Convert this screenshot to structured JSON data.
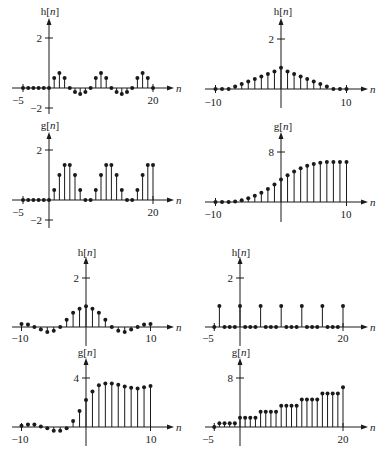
{
  "figure": {
    "panels_count": 8,
    "colors": {
      "ink": "#1a1a1a",
      "background": "#ffffff"
    }
  },
  "chart_data": [
    {
      "id": "tl-h",
      "type": "stem",
      "title": "h[n]",
      "xlabel": "n",
      "x_tick_labels": [
        "-5",
        "20"
      ],
      "y_tick_labels": [
        "2",
        "-2"
      ],
      "xlim": [
        -5,
        20
      ],
      "ylim": [
        -2,
        2
      ],
      "x": [
        -5,
        -4,
        -3,
        -2,
        -1,
        0,
        1,
        2,
        3,
        4,
        5,
        6,
        7,
        8,
        9,
        10,
        11,
        12,
        13,
        14,
        15,
        16,
        17,
        18,
        19,
        20
      ],
      "values": [
        0,
        0,
        0,
        0,
        0,
        0,
        0.4,
        0.6,
        0.4,
        0,
        -0.4,
        -0.6,
        -0.4,
        0,
        0.4,
        0.6,
        0.4,
        0,
        -0.4,
        -0.6,
        -0.4,
        0,
        0.4,
        0.6,
        0.4,
        0
      ],
      "layout": {
        "x0": 49,
        "xscale": 5.2,
        "axis_y": 88,
        "yscale_up": 25,
        "yscale_down": 10,
        "ytick_pos_y": 38,
        "ytick_neg_y": 108,
        "axis_left": 12,
        "axis_right": 168,
        "axis_top": 24,
        "axis_bottom": 114,
        "title_x": 50,
        "title_y": 15,
        "n_label_x": 176,
        "xtick_label_y": 104,
        "xtick_label_xs": [
          18,
          153
        ]
      }
    },
    {
      "id": "tl-g",
      "type": "stem",
      "title": "g[n]",
      "xlabel": "n",
      "x_tick_labels": [
        "-5",
        "20"
      ],
      "y_tick_labels": [
        "2",
        "-2"
      ],
      "xlim": [
        -5,
        20
      ],
      "ylim": [
        -2,
        2
      ],
      "x": [
        -5,
        -4,
        -3,
        -2,
        -1,
        0,
        1,
        2,
        3,
        4,
        5,
        6,
        7,
        8,
        9,
        10,
        11,
        12,
        13,
        14,
        15,
        16,
        17,
        18,
        19,
        20
      ],
      "values": [
        0,
        0,
        0,
        0,
        0,
        0,
        0.4,
        1.0,
        1.4,
        1.4,
        1.0,
        0.4,
        0,
        0,
        0.4,
        1.0,
        1.4,
        1.4,
        1.0,
        0.4,
        0,
        0,
        0.4,
        1.0,
        1.4,
        1.4
      ],
      "layout": {
        "x0": 49,
        "xscale": 5.2,
        "axis_y": 200,
        "yscale_up": 25,
        "yscale_down": 10,
        "ytick_pos_y": 150,
        "ytick_neg_y": 220,
        "axis_left": 12,
        "axis_right": 168,
        "axis_top": 138,
        "axis_bottom": 228,
        "title_x": 50,
        "title_y": 129,
        "n_label_x": 176,
        "xtick_label_y": 216,
        "xtick_label_xs": [
          18,
          153
        ]
      }
    },
    {
      "id": "tr-h",
      "type": "stem",
      "title": "h[n]",
      "xlabel": "n",
      "x_tick_labels": [
        "-10",
        "10"
      ],
      "y_tick_labels": [
        "2"
      ],
      "xlim": [
        -10,
        10
      ],
      "ylim": [
        0,
        2
      ],
      "x": [
        -10,
        -9,
        -8,
        -7,
        -6,
        -5,
        -4,
        -3,
        -2,
        -1,
        0,
        1,
        2,
        3,
        4,
        5,
        6,
        7,
        8,
        9,
        10
      ],
      "values": [
        0,
        0,
        0,
        0.1,
        0.2,
        0.3,
        0.4,
        0.5,
        0.6,
        0.7,
        0.85,
        0.7,
        0.6,
        0.5,
        0.4,
        0.3,
        0.2,
        0.1,
        0,
        0,
        0
      ],
      "layout": {
        "x0": 281,
        "xscale": 6.55,
        "axis_y": 89,
        "yscale_up": 25,
        "yscale_down": 10,
        "ytick_pos_y": 39,
        "ytick_neg_y": null,
        "axis_left": 205,
        "axis_right": 362,
        "axis_top": 24,
        "axis_bottom": 108,
        "title_x": 283,
        "title_y": 15,
        "n_label_x": 370,
        "xtick_label_y": 106,
        "xtick_label_xs": [
          213,
          346
        ]
      }
    },
    {
      "id": "tr-g",
      "type": "stem",
      "title": "g[n]",
      "xlabel": "n",
      "x_tick_labels": [
        "-10",
        "10"
      ],
      "y_tick_labels": [
        "8"
      ],
      "xlim": [
        -10,
        10
      ],
      "ylim": [
        0,
        8
      ],
      "x": [
        -10,
        -9,
        -8,
        -7,
        -6,
        -5,
        -4,
        -3,
        -2,
        -1,
        0,
        1,
        2,
        3,
        4,
        5,
        6,
        7,
        8,
        9,
        10
      ],
      "values": [
        0,
        0,
        0,
        0.1,
        0.3,
        0.6,
        1.0,
        1.5,
        2.1,
        2.8,
        3.6,
        4.3,
        4.9,
        5.4,
        5.8,
        6.1,
        6.3,
        6.4,
        6.4,
        6.4,
        6.4
      ],
      "layout": {
        "x0": 281,
        "xscale": 6.55,
        "axis_y": 202,
        "yscale_up": 6.25,
        "yscale_down": 6.25,
        "ytick_pos_y": 152,
        "ytick_neg_y": null,
        "axis_left": 205,
        "axis_right": 362,
        "axis_top": 138,
        "axis_bottom": 222,
        "title_x": 283,
        "title_y": 130,
        "n_label_x": 370,
        "xtick_label_y": 218,
        "xtick_label_xs": [
          213,
          346
        ]
      }
    },
    {
      "id": "bl-h",
      "type": "stem",
      "title": "h[n]",
      "xlabel": "n",
      "x_tick_labels": [
        "-10",
        "10"
      ],
      "y_tick_labels": [
        "2"
      ],
      "xlim": [
        -10,
        10
      ],
      "ylim": [
        0,
        2
      ],
      "x": [
        -10,
        -9,
        -8,
        -7,
        -6,
        -5,
        -4,
        -3,
        -2,
        -1,
        0,
        1,
        2,
        3,
        4,
        5,
        6,
        7,
        8,
        9,
        10
      ],
      "values": [
        0.12,
        0.1,
        0,
        -0.1,
        -0.2,
        -0.15,
        0,
        0.3,
        0.58,
        0.75,
        0.85,
        0.75,
        0.58,
        0.3,
        0,
        -0.15,
        -0.2,
        -0.1,
        0,
        0.1,
        0.12
      ],
      "layout": {
        "x0": 86,
        "xscale": 6.45,
        "axis_y": 327,
        "yscale_up": 24.5,
        "yscale_down": 24.5,
        "ytick_pos_y": 278,
        "ytick_neg_y": null,
        "axis_left": 12,
        "axis_right": 168,
        "axis_top": 263,
        "axis_bottom": 346,
        "title_x": 87,
        "title_y": 256,
        "n_label_x": 176,
        "xtick_label_y": 342,
        "xtick_label_xs": [
          20,
          151
        ]
      }
    },
    {
      "id": "bl-g",
      "type": "stem",
      "title": "g[n]",
      "xlabel": "n",
      "x_tick_labels": [
        "-10",
        "10"
      ],
      "y_tick_labels": [
        "4"
      ],
      "xlim": [
        -10,
        10
      ],
      "ylim": [
        0,
        4
      ],
      "x": [
        -10,
        -9,
        -8,
        -7,
        -6,
        -5,
        -4,
        -3,
        -2,
        -1,
        0,
        1,
        2,
        3,
        4,
        5,
        6,
        7,
        8,
        9,
        10
      ],
      "values": [
        0.1,
        0.2,
        0.2,
        0.05,
        -0.1,
        -0.3,
        -0.3,
        -0.1,
        0.5,
        1.3,
        2.2,
        2.9,
        3.4,
        3.55,
        3.55,
        3.45,
        3.3,
        3.2,
        3.15,
        3.25,
        3.35
      ],
      "layout": {
        "x0": 86,
        "xscale": 6.45,
        "axis_y": 427,
        "yscale_up": 12.25,
        "yscale_down": 12.25,
        "ytick_pos_y": 378,
        "ytick_neg_y": null,
        "axis_left": 12,
        "axis_right": 168,
        "axis_top": 364,
        "axis_bottom": 446,
        "title_x": 87,
        "title_y": 356,
        "n_label_x": 176,
        "xtick_label_y": 443,
        "xtick_label_xs": [
          20,
          151
        ]
      }
    },
    {
      "id": "br-h",
      "type": "stem",
      "title": "h[n]",
      "xlabel": "n",
      "x_tick_labels": [
        "-5",
        "20"
      ],
      "y_tick_labels": [
        "2"
      ],
      "xlim": [
        -5,
        20
      ],
      "ylim": [
        0,
        2
      ],
      "x": [
        -5,
        -4,
        -3,
        -2,
        -1,
        0,
        1,
        2,
        3,
        4,
        5,
        6,
        7,
        8,
        9,
        10,
        11,
        12,
        13,
        14,
        15,
        16,
        17,
        18,
        19,
        20
      ],
      "values": [
        0,
        0.86,
        0,
        0,
        0,
        0.86,
        0,
        0,
        0,
        0.86,
        0,
        0,
        0,
        0.86,
        0,
        0,
        0,
        0.86,
        0,
        0,
        0,
        0.86,
        0,
        0,
        0,
        0.86
      ],
      "layout": {
        "x0": 240,
        "xscale": 5.15,
        "axis_y": 327,
        "yscale_up": 24.5,
        "yscale_down": 24.5,
        "ytick_pos_y": 278,
        "ytick_neg_y": null,
        "axis_left": 205,
        "axis_right": 362,
        "axis_top": 263,
        "axis_bottom": 346,
        "title_x": 241,
        "title_y": 256,
        "n_label_x": 370,
        "xtick_label_y": 342,
        "xtick_label_xs": [
          208,
          343
        ]
      }
    },
    {
      "id": "br-g",
      "type": "stem",
      "title": "g[n]",
      "xlabel": "n",
      "x_tick_labels": [
        "-5",
        "20"
      ],
      "y_tick_labels": [
        "8"
      ],
      "xlim": [
        -5,
        20
      ],
      "ylim": [
        0,
        8
      ],
      "x": [
        -5,
        -4,
        -3,
        -2,
        -1,
        0,
        1,
        2,
        3,
        4,
        5,
        6,
        7,
        8,
        9,
        10,
        11,
        12,
        13,
        14,
        15,
        16,
        17,
        18,
        19,
        20
      ],
      "values": [
        0,
        0.6,
        0.6,
        0.6,
        0.6,
        1.5,
        1.5,
        1.5,
        1.5,
        2.5,
        2.5,
        2.5,
        2.5,
        3.5,
        3.5,
        3.5,
        3.5,
        4.5,
        4.5,
        4.5,
        4.5,
        5.5,
        5.5,
        5.5,
        5.5,
        6.5
      ],
      "layout": {
        "x0": 240,
        "xscale": 5.15,
        "axis_y": 427,
        "yscale_up": 6.1,
        "yscale_down": 6.1,
        "ytick_pos_y": 378,
        "ytick_neg_y": null,
        "axis_left": 205,
        "axis_right": 362,
        "axis_top": 364,
        "axis_bottom": 446,
        "title_x": 241,
        "title_y": 356,
        "n_label_x": 370,
        "xtick_label_y": 443,
        "xtick_label_xs": [
          208,
          343
        ]
      }
    }
  ]
}
